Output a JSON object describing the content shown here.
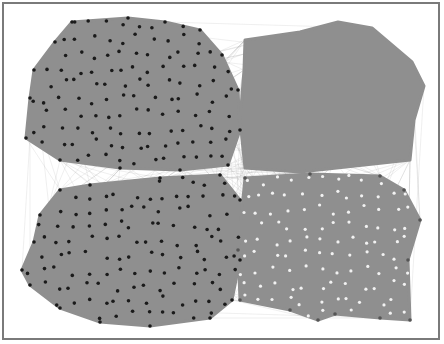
{
  "figure": {
    "type": "network-graph",
    "background": "#ffffff",
    "frame_color": "#7a7a7a",
    "edge_color": "#8e8e8e",
    "cluster_fill": "#8f8f8f",
    "dark_node_color": "#1a1a1a",
    "light_node_color": "#f2f2f2"
  },
  "clusters": [
    {
      "name": "top-left",
      "node_color": "dark",
      "polygon": [
        [
          72,
          22
        ],
        [
          128,
          18
        ],
        [
          165,
          22
        ],
        [
          200,
          30
        ],
        [
          222,
          55
        ],
        [
          238,
          90
        ],
        [
          240,
          130
        ],
        [
          228,
          165
        ],
        [
          180,
          170
        ],
        [
          120,
          168
        ],
        [
          60,
          160
        ],
        [
          26,
          138
        ],
        [
          30,
          98
        ],
        [
          34,
          70
        ],
        [
          55,
          42
        ]
      ]
    },
    {
      "name": "bottom-left",
      "node_color": "dark",
      "polygon": [
        [
          60,
          190
        ],
        [
          90,
          185
        ],
        [
          160,
          178
        ],
        [
          220,
          175
        ],
        [
          240,
          200
        ],
        [
          240,
          260
        ],
        [
          232,
          300
        ],
        [
          210,
          318
        ],
        [
          150,
          326
        ],
        [
          100,
          322
        ],
        [
          60,
          308
        ],
        [
          30,
          285
        ],
        [
          22,
          270
        ],
        [
          34,
          242
        ],
        [
          40,
          215
        ]
      ]
    },
    {
      "name": "top-right",
      "node_color": "none",
      "polygon": [
        [
          245,
          40
        ],
        [
          300,
          32
        ],
        [
          338,
          22
        ],
        [
          372,
          28
        ],
        [
          412,
          62
        ],
        [
          424,
          86
        ],
        [
          414,
          120
        ],
        [
          410,
          160
        ],
        [
          300,
          172
        ],
        [
          245,
          168
        ],
        [
          240,
          120
        ],
        [
          244,
          70
        ]
      ]
    },
    {
      "name": "bottom-right",
      "node_color": "light",
      "polygon": [
        [
          245,
          178
        ],
        [
          310,
          174
        ],
        [
          380,
          176
        ],
        [
          404,
          190
        ],
        [
          420,
          220
        ],
        [
          408,
          260
        ],
        [
          410,
          320
        ],
        [
          380,
          318
        ],
        [
          335,
          314
        ],
        [
          318,
          320
        ],
        [
          290,
          310
        ],
        [
          240,
          300
        ],
        [
          238,
          250
        ]
      ]
    }
  ]
}
